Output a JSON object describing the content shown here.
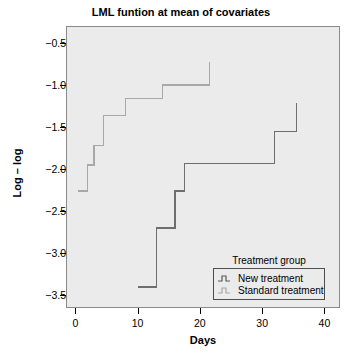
{
  "chart_data": {
    "type": "line",
    "title": "LML funtion at mean of covariates",
    "xlabel": "Days",
    "ylabel": "Log – log",
    "xlim": [
      -1.5,
      42.5
    ],
    "ylim": [
      -3.65,
      -0.3
    ],
    "xticks": [
      0,
      10,
      20,
      30,
      40
    ],
    "xtick_labels": [
      "0",
      "10",
      "20",
      "30",
      "40"
    ],
    "yticks": [
      -0.5,
      -1.0,
      -1.5,
      -2.0,
      -2.5,
      -3.0,
      -3.5
    ],
    "ytick_labels": [
      "−0.5",
      "−1.0",
      "−1.5",
      "−2.0",
      "−2.5",
      "−3.0",
      "−3.5"
    ],
    "grid": false,
    "legend_position": "bottom-right",
    "step_style": "post",
    "series": [
      {
        "name": "New treatment",
        "color": "#6e6e6e",
        "points": [
          [
            10.0,
            -3.4
          ],
          [
            13.0,
            -3.4
          ],
          [
            13.0,
            -2.7
          ],
          [
            16.0,
            -2.7
          ],
          [
            16.0,
            -2.26
          ],
          [
            17.5,
            -2.26
          ],
          [
            17.5,
            -1.93
          ],
          [
            32.0,
            -1.93
          ],
          [
            32.0,
            -1.55
          ],
          [
            35.5,
            -1.55
          ],
          [
            35.5,
            -1.22
          ]
        ]
      },
      {
        "name": "Standard treatment",
        "color": "#a8a8a8",
        "points": [
          [
            0.5,
            -2.26
          ],
          [
            2.0,
            -2.26
          ],
          [
            2.0,
            -1.95
          ],
          [
            3.0,
            -1.95
          ],
          [
            3.0,
            -1.72
          ],
          [
            4.5,
            -1.72
          ],
          [
            4.5,
            -1.36
          ],
          [
            8.0,
            -1.36
          ],
          [
            8.0,
            -1.16
          ],
          [
            14.0,
            -1.16
          ],
          [
            14.0,
            -1.0
          ],
          [
            21.5,
            -1.0
          ],
          [
            21.5,
            -0.73
          ]
        ]
      }
    ]
  },
  "legend": {
    "title": "Treatment group",
    "entries": [
      {
        "label": "New treatment",
        "glyph": "step-line-dark"
      },
      {
        "label": "Standard treatment",
        "glyph": "step-line-light"
      }
    ]
  },
  "colors": {
    "plot_background": "#ebebeb",
    "frame": "#8a8a8a",
    "new_treatment": "#6e6e6e",
    "standard_treatment": "#a8a8a8",
    "text": "#000000"
  }
}
